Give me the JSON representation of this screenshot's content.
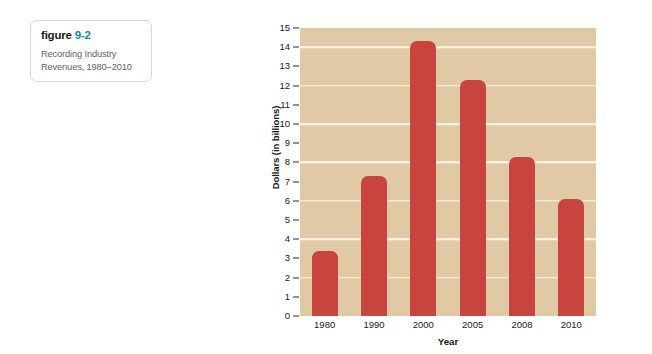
{
  "caption": {
    "label": "figure",
    "number": "9-2",
    "subtitle_line1": "Recording Industry",
    "subtitle_line2": "Revenues, 1980–2010",
    "number_color": "#0d8a9c"
  },
  "chart_data": {
    "type": "bar",
    "title": "Recording Industry Revenues, 1980–2010",
    "categories": [
      "1980",
      "1990",
      "2000",
      "2005",
      "2008",
      "2010"
    ],
    "values": [
      3.4,
      7.3,
      14.3,
      12.3,
      8.3,
      6.1
    ],
    "xlabel": "Year",
    "ylabel": "Dollars (in billions)",
    "ylim": [
      0,
      15
    ],
    "ytick_labels": [
      "0",
      "1",
      "2",
      "3",
      "4",
      "5",
      "6",
      "7",
      "8",
      "9",
      "10",
      "11",
      "12",
      "13",
      "14",
      "15"
    ],
    "ytick_values": [
      0,
      1,
      2,
      3,
      4,
      5,
      6,
      7,
      8,
      9,
      10,
      11,
      12,
      13,
      14,
      15
    ],
    "gridlines": [
      2,
      4,
      6,
      8,
      10,
      12,
      14
    ],
    "grid": true,
    "legend": null,
    "bar_color": "#c7453e",
    "plot_background": "#e2c9a6",
    "gridline_color": "#fbf7ef"
  }
}
